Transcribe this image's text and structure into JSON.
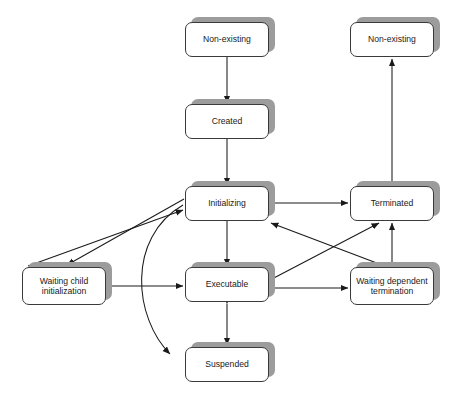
{
  "diagram": {
    "type": "state-diagram",
    "background_color": "#ffffff",
    "node_fill_color": "#ffffff",
    "node_border_color": "#3a3a3a",
    "node_shadow_color": "#9c9c9c",
    "edge_color": "#1a1a1a",
    "nodes": [
      {
        "id": "nonexisting_start",
        "label": "Non-existing",
        "x": 185,
        "y": 22,
        "w": 84,
        "h": 35
      },
      {
        "id": "created",
        "label": "Created",
        "x": 185,
        "y": 104,
        "w": 84,
        "h": 35
      },
      {
        "id": "initializing",
        "label": "Initializing",
        "x": 185,
        "y": 186,
        "w": 84,
        "h": 35
      },
      {
        "id": "executable",
        "label": "Executable",
        "x": 185,
        "y": 267,
        "w": 84,
        "h": 35
      },
      {
        "id": "suspended",
        "label": "Suspended",
        "x": 185,
        "y": 347,
        "w": 84,
        "h": 35
      },
      {
        "id": "waiting_child",
        "label": "Waiting child initialization",
        "label_line1": "Waiting child",
        "label_line2": "initialization",
        "x": 22,
        "y": 267,
        "w": 84,
        "h": 38
      },
      {
        "id": "waiting_dependent",
        "label": "Waiting dependent termination",
        "label_line1": "Waiting dependent",
        "label_line2": "termination",
        "x": 350,
        "y": 267,
        "w": 84,
        "h": 38
      },
      {
        "id": "terminated",
        "label": "Terminated",
        "x": 350,
        "y": 186,
        "w": 84,
        "h": 35
      },
      {
        "id": "nonexisting_end",
        "label": "Non-existing",
        "x": 350,
        "y": 22,
        "w": 84,
        "h": 35
      }
    ],
    "edges": [
      {
        "id": "e1",
        "from": "nonexisting_start",
        "to": "created",
        "style": "straight",
        "direction": "one-way"
      },
      {
        "id": "e2",
        "from": "created",
        "to": "initializing",
        "style": "straight",
        "direction": "one-way"
      },
      {
        "id": "e3",
        "from": "initializing",
        "to": "executable",
        "style": "straight",
        "direction": "one-way"
      },
      {
        "id": "e4",
        "from": "executable",
        "to": "suspended",
        "style": "straight",
        "direction": "two-way"
      },
      {
        "id": "e5",
        "from": "initializing",
        "to": "waiting_child",
        "style": "straight",
        "direction": "one-way"
      },
      {
        "id": "e6",
        "from": "waiting_child",
        "to": "initializing",
        "style": "straight",
        "direction": "one-way"
      },
      {
        "id": "e7",
        "from": "waiting_child",
        "to": "executable",
        "style": "straight",
        "direction": "two-way"
      },
      {
        "id": "e8",
        "from": "initializing",
        "to": "suspended",
        "style": "curved",
        "direction": "one-way"
      },
      {
        "id": "e9",
        "from": "suspended",
        "to": "initializing",
        "style": "curved",
        "direction": "one-way"
      },
      {
        "id": "e10",
        "from": "initializing",
        "to": "terminated",
        "style": "straight",
        "direction": "one-way"
      },
      {
        "id": "e11",
        "from": "executable",
        "to": "waiting_dependent",
        "style": "straight",
        "direction": "two-way"
      },
      {
        "id": "e12",
        "from": "executable",
        "to": "terminated",
        "style": "straight",
        "direction": "one-way"
      },
      {
        "id": "e13",
        "from": "waiting_dependent",
        "to": "initializing",
        "style": "straight",
        "direction": "one-way"
      },
      {
        "id": "e14",
        "from": "waiting_dependent",
        "to": "terminated",
        "style": "straight",
        "direction": "one-way"
      },
      {
        "id": "e15",
        "from": "terminated",
        "to": "nonexisting_end",
        "style": "straight",
        "direction": "one-way"
      }
    ]
  }
}
